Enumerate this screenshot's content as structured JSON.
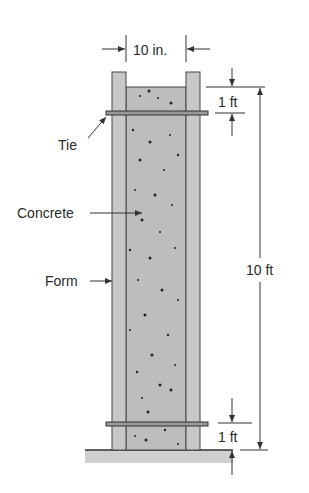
{
  "diagram": {
    "labels": {
      "width": "10 in.",
      "tie": "Tie",
      "concrete": "Concrete",
      "form": "Form",
      "height": "10 ft",
      "top_tie_offset": "1 ft",
      "bottom_tie_offset": "1 ft"
    },
    "colors": {
      "form": "#c8c8c8",
      "concrete": "#bdbdbd",
      "ground": "#cfcfcf",
      "line": "#333333",
      "text": "#2a2a2a"
    }
  }
}
